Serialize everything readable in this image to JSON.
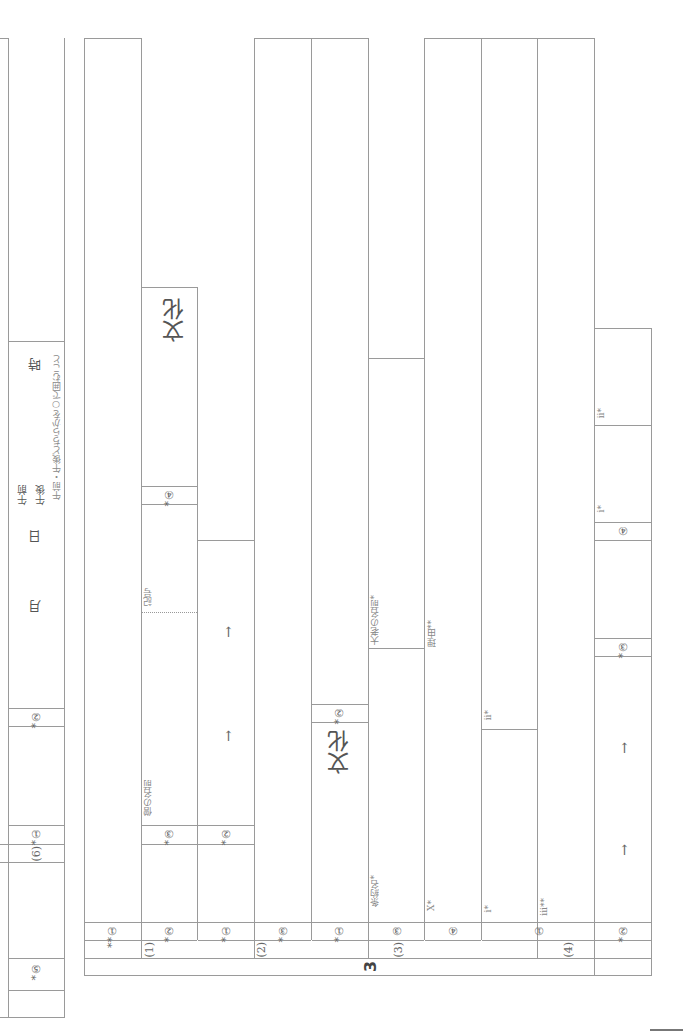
{
  "section_number": "3",
  "time_box": {
    "question": "*⑤",
    "sub6_label": "(6)",
    "sub6_q1": "*①",
    "sub6_q2": "*②",
    "month": "月",
    "day": "日",
    "am": "午前",
    "pm": "午後",
    "hour": "時",
    "note": "午前・午後どちらかを○で囲むこと"
  },
  "part1": {
    "label": "(1)",
    "q1": "**①",
    "q2": "*②",
    "q3": "*③",
    "q3_field": "僧の名前",
    "q3_dotted_field": "記号",
    "q4": "*④",
    "q4_answer_suffix": "文化"
  },
  "part2": {
    "label": "(2)",
    "q1": "*①",
    "q2": "*②",
    "q3": "*③",
    "arrows": [
      "→",
      "→"
    ]
  },
  "part3": {
    "label": "(3)",
    "q1": "*①",
    "q1_suffix": "文化",
    "q2": "*②",
    "q3": "③",
    "q3_field_a": "条約名*",
    "q3_field_b": "大老の名前*",
    "q4": "④",
    "q4_field_a": "X*",
    "q4_field_b": "理由**"
  },
  "part4": {
    "label": "(4)",
    "q1": "①",
    "q1_i": "i*",
    "q1_ii": "ii*",
    "q1_iii": "iii**",
    "q2": "*②",
    "q2_arrows": [
      "→",
      "→"
    ],
    "q3": "*③",
    "q4": "④",
    "q4_i": "i*",
    "q4_ii": "ii*"
  }
}
